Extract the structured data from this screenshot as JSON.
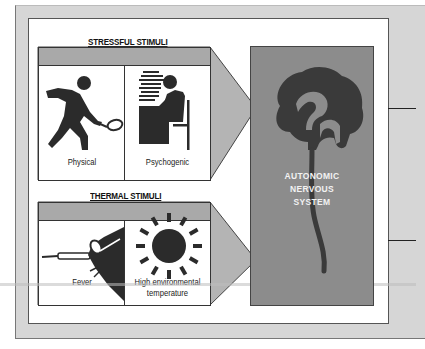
{
  "diagram": {
    "sections": [
      {
        "title": "STRESSFUL STIMULI",
        "panels": [
          {
            "caption": "Physical",
            "icon": "tennis-player-icon"
          },
          {
            "caption": "Psychogenic",
            "icon": "person-at-desk-icon"
          }
        ]
      },
      {
        "title": "THERMAL STIMULI",
        "panels": [
          {
            "caption": "Fever",
            "icon": "thermometer-hand-icon"
          },
          {
            "caption_line1": "High environmental",
            "caption_line2": "temperature",
            "icon": "sun-icon"
          }
        ]
      }
    ],
    "target": {
      "line1": "AUTONOMIC",
      "line2": "NERVOUS",
      "line3": "SYSTEM",
      "icon": "brain-spinal-cord-icon"
    },
    "colors": {
      "frame": "#d6d6d6",
      "band": "#a9a9a9",
      "arrow": "#b4b4b4",
      "target_box": "#8c8c8c",
      "icon_fill": "#2b2b2b"
    }
  }
}
